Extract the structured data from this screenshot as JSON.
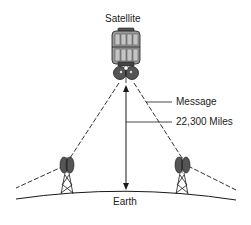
{
  "diagram": {
    "labels": {
      "satellite": "Satellite",
      "message": "Message",
      "distance": "22,300 Miles",
      "earth": "Earth"
    },
    "colors": {
      "line": "#1a1a1a",
      "body_fill": "#9a9a9a",
      "dish_fill": "#555555",
      "background": "#ffffff"
    },
    "icons": [
      "satellite-icon",
      "dish-tower-icon",
      "dish-tower-icon"
    ]
  }
}
